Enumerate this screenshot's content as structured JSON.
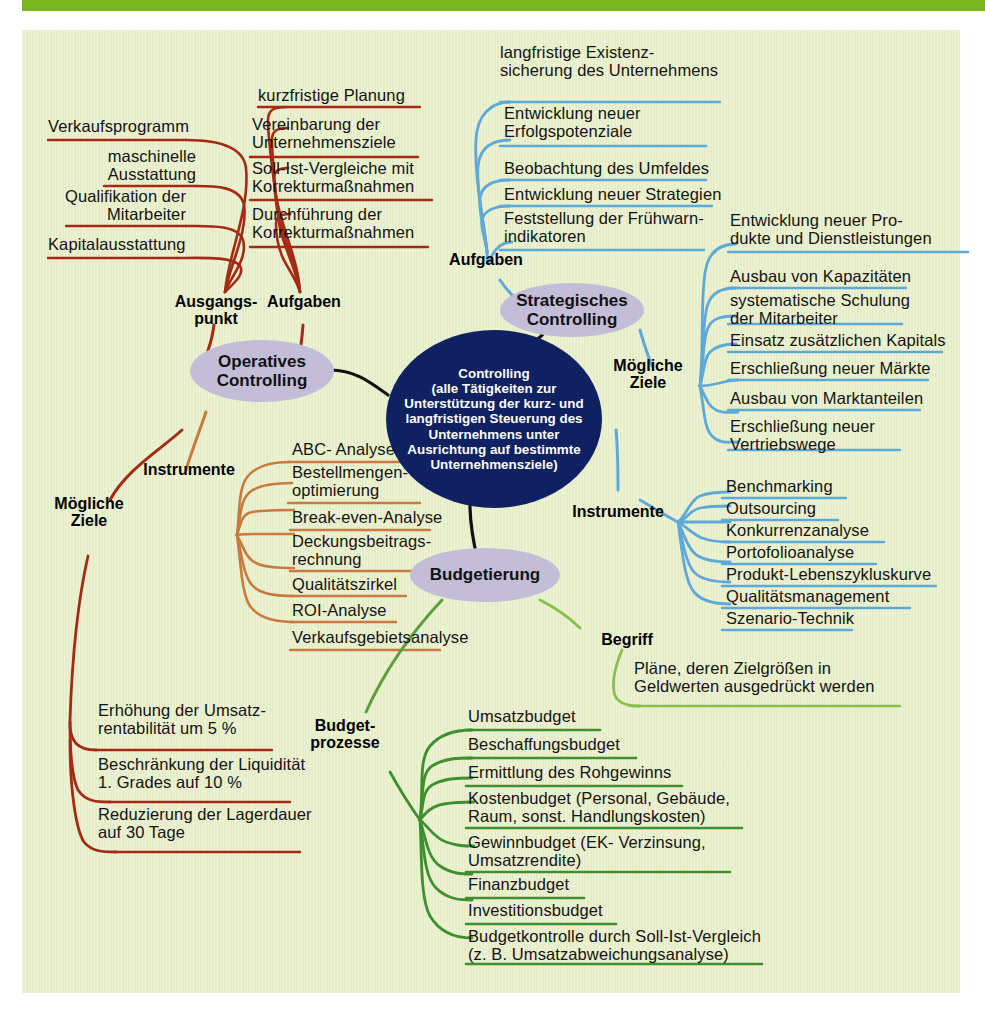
{
  "theme": {
    "page_bg": "#ffffff",
    "panel_bg": "#e6eec8",
    "topbar_color": "#7ab51d",
    "center_node_bg": "#0f2160",
    "center_node_text": "#ffffff",
    "ellipse_bg": "#c3bdd8",
    "branch_red": "#a52a14",
    "branch_orange": "#c97a3f",
    "branch_blue": "#5fa8d8",
    "branch_green": "#5e9e3a",
    "branch_green_dark": "#3f8f2e",
    "branch_black": "#111111",
    "text_color": "#14120f"
  },
  "diagram": {
    "type": "mind-map",
    "center": {
      "label": "Controlling\n(alle Tätigkeiten zur\nUnterstützung der kurz- und\nlangfristigen Steuerung des\nUnternehmens unter\nAusrichtung auf bestimmte\nUnternehmensziele)"
    },
    "nodes": {
      "operatives": "Operatives\nControlling",
      "strategisches": "Strategisches\nControlling",
      "budgetierung": "Budgetierung"
    },
    "connector_labels": {
      "ausgangspunkt": "Ausgangs-\npunkt",
      "aufgaben_op": "Aufgaben",
      "instrumente_op": "Instrumente",
      "moegliche_ziele_op": "Mögliche\nZiele",
      "aufgaben_strat": "Aufgaben",
      "moegliche_ziele_strat": "Mögliche\nZiele",
      "instrumente_strat": "Instrumente",
      "begriff": "Begriff",
      "budgetprozesse": "Budget-\nprozesse"
    },
    "branches": {
      "ausgangspunkt_items": [
        "Verkaufsprogramm",
        "maschinelle\nAusstattung",
        "Qualifikation der\nMitarbeiter",
        "Kapitalausstattung"
      ],
      "aufgaben_op_items": [
        "kurzfristige Planung",
        "Vereinbarung der\nUnternehmensziele",
        "Soll-Ist-Vergleiche mit\nKorrekturmaßnahmen",
        "Durchführung der\nKorrekturmaßnahmen"
      ],
      "instrumente_op_items": [
        "ABC- Analyse",
        "Bestellmengen-\noptimierung",
        "Break-even-Analyse",
        "Deckungsbeitrags-\nrechnung",
        "Qualitätszirkel",
        "ROI-Analyse",
        "Verkaufsgebietsanalyse"
      ],
      "moegliche_ziele_op_items": [
        "Erhöhung der Umsatz-\nrentabilität um 5 %",
        "Beschränkung der Liquidität\n1. Grades auf 10 %",
        "Reduzierung der Lagerdauer\nauf 30 Tage"
      ],
      "aufgaben_strat_items": [
        "langfristige Existenz-\nsicherung des Unternehmens",
        "Entwicklung neuer\nErfolgspotenziale",
        "Beobachtung des Umfeldes",
        "Entwicklung neuer Strategien",
        "Feststellung der Frühwarn-\nindikatoren"
      ],
      "moegliche_ziele_strat_items": [
        "Entwicklung neuer Pro-\ndukte und Dienstleistungen",
        "Ausbau von Kapazitäten",
        "systematische Schulung\nder Mitarbeiter",
        "Einsatz zusätzlichen Kapitals",
        "Erschließung neuer Märkte",
        "Ausbau von Marktanteilen",
        "Erschließung neuer\nVertriebswege"
      ],
      "instrumente_strat_items": [
        "Benchmarking",
        "Outsourcing",
        "Konkurrenzanalyse",
        "Portofolioanalyse",
        "Produkt-Lebenszykluskurve",
        "Qualitätsmanagement",
        "Szenario-Technik"
      ],
      "begriff_items": [
        "Pläne, deren Zielgrößen in\nGeldwerten ausgedrückt werden"
      ],
      "budgetprozesse_items": [
        "Umsatzbudget",
        "Beschaffungsbudget",
        "Ermittlung des Rohgewinns",
        "Kostenbudget (Personal, Gebäude,\nRaum, sonst. Handlungskosten)",
        "Gewinnbudget (EK- Verzinsung,\nUmsatzrendite)",
        "Finanzbudget",
        "Investitionsbudget",
        "Budgetkontrolle durch Soll-Ist-Vergleich\n(z. B. Umsatzabweichungsanalyse)"
      ]
    }
  }
}
